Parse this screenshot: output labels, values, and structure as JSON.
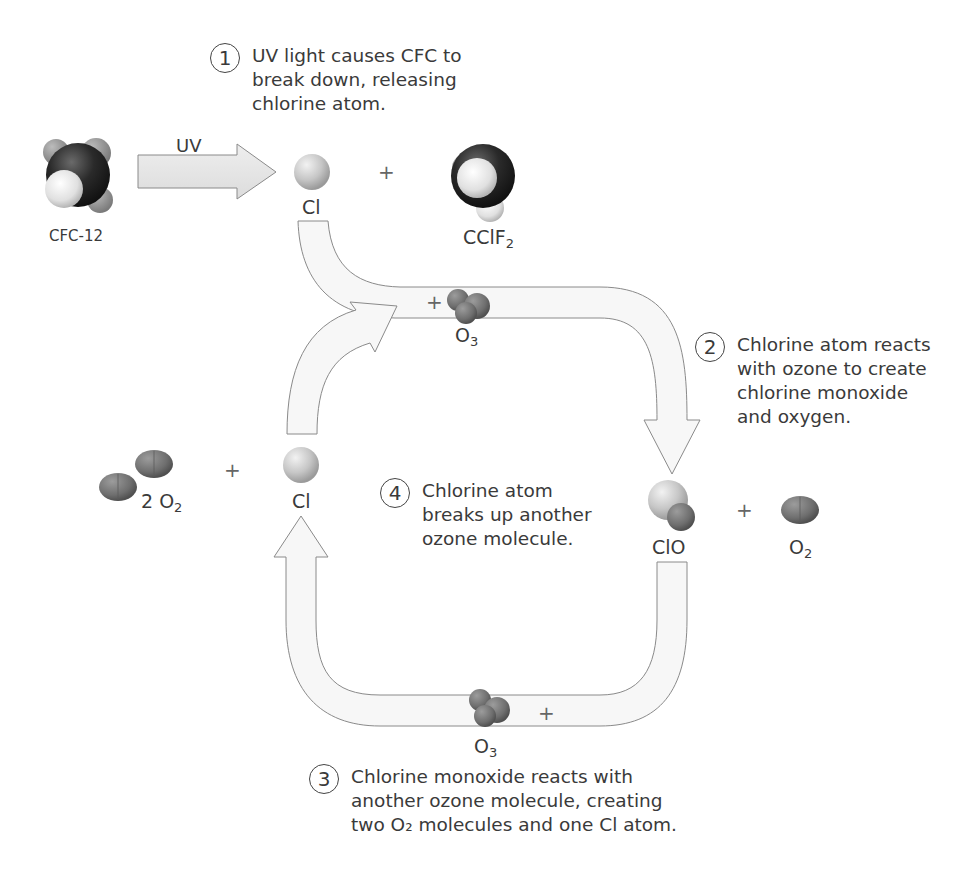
{
  "diagram": {
    "colors": {
      "arrow_fill": "#f6f6f6",
      "arrow_stroke": "#8a8a8a",
      "uv_arrow_fill": "#e4e4e4",
      "text": "#3a3a3a",
      "oxygen": "#7a7a7a",
      "chlorine": "#c8c8c8",
      "carbon": "#2a2a2a",
      "fluorine": "#9a9a9a"
    },
    "steps": [
      {
        "number": "1",
        "lines": [
          "UV light causes CFC to",
          "break down, releasing",
          "chlorine atom."
        ]
      },
      {
        "number": "2",
        "lines": [
          "Chlorine atom reacts",
          "with ozone to create",
          "chlorine monoxide",
          "and oxygen."
        ]
      },
      {
        "number": "3",
        "lines": [
          "Chlorine monoxide reacts with",
          "another ozone molecule, creating",
          "two O₂ molecules and one Cl atom."
        ]
      },
      {
        "number": "4",
        "lines": [
          "Chlorine atom",
          "breaks up another",
          "ozone molecule."
        ]
      }
    ],
    "molecules": {
      "cfc12": {
        "label": "CFC-12"
      },
      "cl_top": {
        "label": "Cl"
      },
      "cclf2": {
        "label": "CClF",
        "sub": "2"
      },
      "o3_top": {
        "label": "O",
        "sub": "3"
      },
      "clo": {
        "label": "ClO"
      },
      "o2_right": {
        "label": "O",
        "sub": "2"
      },
      "o3_bottom": {
        "label": "O",
        "sub": "3"
      },
      "cl_left": {
        "label": "Cl"
      },
      "two_o2": {
        "label": "2 O",
        "sub": "2"
      }
    },
    "uv_arrow_label": "UV",
    "plus_sign": "+"
  }
}
